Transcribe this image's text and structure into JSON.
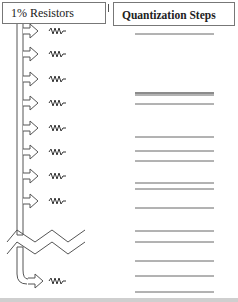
{
  "left_panel": {
    "title": "1% Resistors",
    "items": [
      {
        "type": "tap-arrow-resistor",
        "y": 31
      },
      {
        "type": "tap-arrow-resistor",
        "y": 54
      },
      {
        "type": "tap-arrow-resistor",
        "y": 79
      },
      {
        "type": "tap-arrow-resistor",
        "y": 103
      },
      {
        "type": "tap-arrow-resistor",
        "y": 128
      },
      {
        "type": "tap-arrow-resistor",
        "y": 152
      },
      {
        "type": "tap-arrow-resistor",
        "y": 176
      },
      {
        "type": "tap-arrow-resistor",
        "y": 201
      },
      {
        "type": "break-symbol",
        "y": 232
      },
      {
        "type": "tap-arrow-resistor",
        "y": 281
      }
    ]
  },
  "right_panel": {
    "title": "Quantization Steps",
    "step_lines_y": [
      34,
      93,
      95,
      104,
      137,
      151,
      161,
      183,
      189,
      208,
      231,
      242,
      261,
      276,
      292
    ]
  },
  "colors": {
    "stroke": "#555555",
    "line": "#666666",
    "box_border": "#777777"
  }
}
